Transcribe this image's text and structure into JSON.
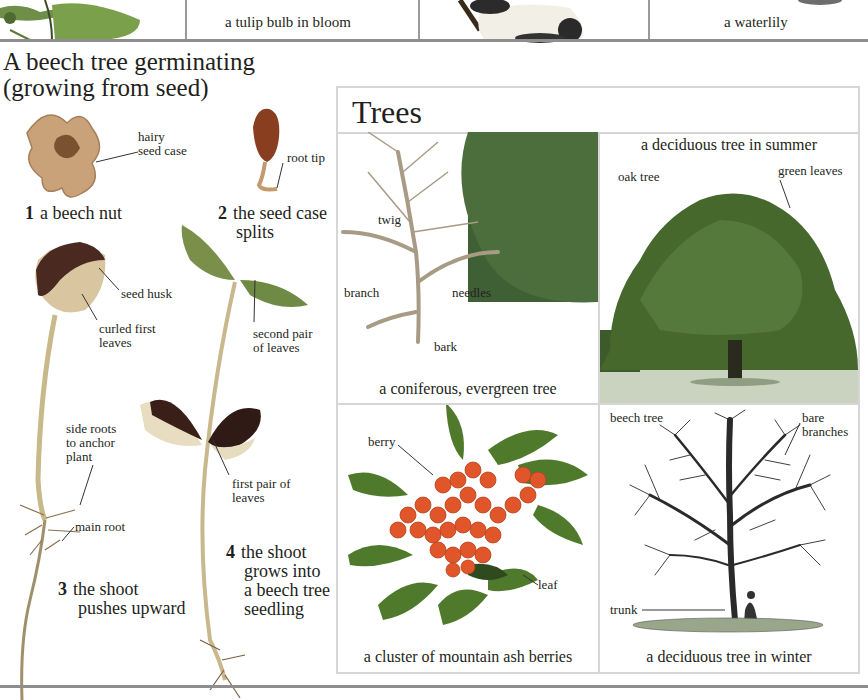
{
  "top_strip": {
    "captions": [
      {
        "text": "a tulip bulb in bloom"
      },
      {
        "text": "a waterlily"
      }
    ]
  },
  "germination": {
    "title_line1": "A beech tree germinating",
    "title_line2": "(growing from seed)",
    "steps": [
      {
        "number": "1",
        "text": "a beech nut"
      },
      {
        "number": "2",
        "text_line1": "the seed case",
        "text_line2": "splits"
      },
      {
        "number": "3",
        "text_line1": "the shoot",
        "text_line2": "pushes upward"
      },
      {
        "number": "4",
        "text_line1": "the shoot",
        "text_line2": "grows into",
        "text_line3": "a beech tree",
        "text_line4": "seedling"
      }
    ],
    "labels": {
      "hairy_seed_case_1": "hairy",
      "hairy_seed_case_2": "seed case",
      "root_tip": "root tip",
      "seed_husk": "seed husk",
      "curled_first_1": "curled first",
      "curled_first_2": "leaves",
      "second_pair_1": "second pair",
      "second_pair_2": "of leaves",
      "side_roots_1": "side roots",
      "side_roots_2": "to anchor",
      "side_roots_3": "plant",
      "first_pair_1": "first pair of",
      "first_pair_2": "leaves",
      "main_root": "main root"
    }
  },
  "trees": {
    "title": "Trees",
    "panels": [
      {
        "caption": "a coniferous, evergreen tree",
        "labels": {
          "twig": "twig",
          "branch": "branch",
          "needles": "needles",
          "bark": "bark"
        }
      },
      {
        "caption": "a deciduous tree in summer",
        "labels": {
          "oak_tree": "oak tree",
          "green_leaves": "green leaves"
        }
      },
      {
        "caption": "a cluster of mountain ash berries",
        "labels": {
          "berry": "berry",
          "leaf": "leaf"
        }
      },
      {
        "caption": "a deciduous tree in winter",
        "labels": {
          "beech_tree": "beech tree",
          "bare_1": "bare",
          "bare_2": "branches",
          "trunk": "trunk"
        }
      }
    ]
  },
  "colors": {
    "rule": "#8e8e8e",
    "frame_border": "#d6d6d6",
    "text": "#231f20",
    "berry": "#e0562a",
    "leaf_green": "#4f7a2c",
    "conifer_green": "#3f5f34"
  }
}
